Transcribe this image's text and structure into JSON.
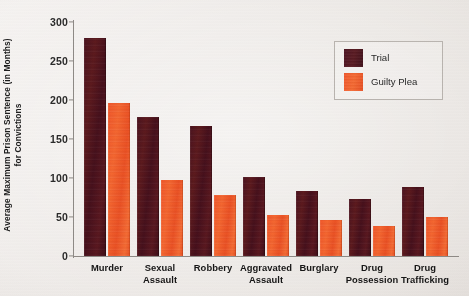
{
  "chart_data": {
    "type": "bar",
    "title": "",
    "xlabel": "",
    "ylabel": "Average Maximum Prison Sentence (in Months) for Convictions",
    "ylabel_line1": "Average Maximum Prison Sentence (in Months)",
    "ylabel_line2": "for Convictions",
    "ylim": [
      0,
      300
    ],
    "yticks": [
      0,
      50,
      100,
      150,
      200,
      250,
      300
    ],
    "ytick_labels": [
      "0",
      "50",
      "100",
      "150",
      "200",
      "250",
      "300"
    ],
    "grid": false,
    "legend_position": "top-right",
    "categories": [
      "Murder",
      "Sexual\nAssault",
      "Robbery",
      "Aggravated\nAssault",
      "Burglary",
      "Drug\nPossession",
      "Drug\nTrafficking"
    ],
    "series": [
      {
        "name": "Trial",
        "color": "#4b1420",
        "values": [
          279,
          178,
          167,
          101,
          83,
          73,
          88
        ]
      },
      {
        "name": "Guilty Plea",
        "color": "#f0562a",
        "values": [
          196,
          97,
          78,
          53,
          46,
          38,
          50
        ]
      }
    ]
  },
  "legend": {
    "items": [
      {
        "label": "Trial",
        "color": "#4b1420"
      },
      {
        "label": "Guilty Plea",
        "color": "#f0562a"
      }
    ]
  }
}
